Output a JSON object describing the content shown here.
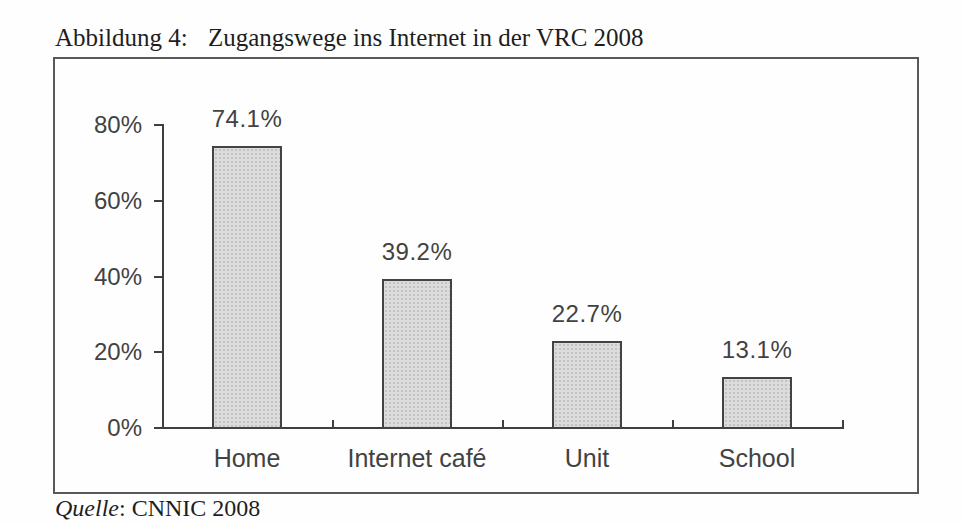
{
  "figure": {
    "label": "Abbildung 4:",
    "title": "Zugangswege ins Internet in der VRC 2008"
  },
  "source": {
    "name": "Quelle",
    "rest": ": CNNIC 2008"
  },
  "chart_data": {
    "type": "bar",
    "title": "Zugangswege ins Internet in der VRC 2008",
    "categories": [
      "Home",
      "Internet café",
      "Unit",
      "School"
    ],
    "values": [
      74.1,
      39.2,
      22.7,
      13.1
    ],
    "value_labels": [
      "74.1%",
      "39.2%",
      "22.7%",
      "13.1%"
    ],
    "xlabel": "",
    "ylabel": "",
    "ylim": [
      0,
      80
    ],
    "y_ticks": [
      0,
      20,
      40,
      60,
      80
    ],
    "y_tick_labels": [
      "0%",
      "20%",
      "40%",
      "60%",
      "80%"
    ],
    "grid": false,
    "legend": null,
    "colors": {
      "bar_fill": "#dcdcdc",
      "bar_dot": "#c2c2c2",
      "bar_border": "#434343",
      "axis": "#3f3f3f",
      "label_text": "#424242"
    }
  }
}
